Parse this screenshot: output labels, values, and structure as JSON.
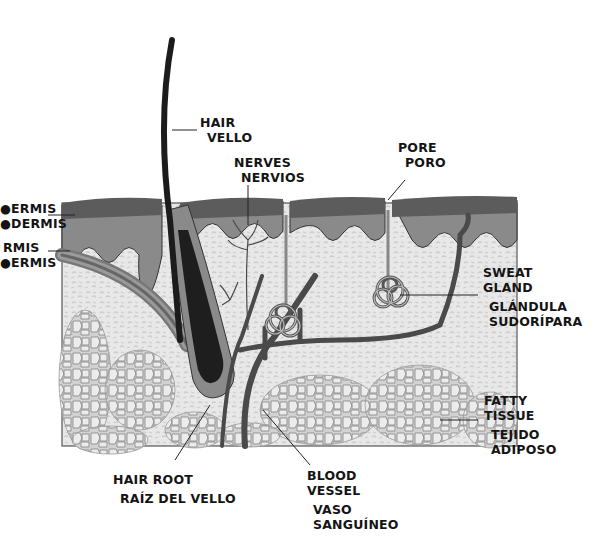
{
  "diagram": {
    "type": "anatomical-cross-section",
    "colors": {
      "epidermis_top": "#5c5c5c",
      "epidermis_base": "#8a8a8a",
      "dermis": "#e6e6e6",
      "dermis_pattern": "#cfcfcf",
      "fat_cells": "#d8d8d8",
      "fat_outline": "#8c8c8c",
      "hair": "#1c1c1c",
      "vessel": "#4a4a4a",
      "label_text": "#141414"
    }
  },
  "labels": {
    "left": {
      "line1": "●ERMIS",
      "line2": "●DERMIS",
      "line3": "RMIS",
      "line4": "●ERMIS"
    },
    "hair": {
      "en": "HAIR",
      "es": "VELLO"
    },
    "nerves": {
      "en": "NERVES",
      "es": "NERVIOS"
    },
    "pore": {
      "en": "PORE",
      "es": "PORO"
    },
    "sweat_gland": {
      "en_1": "SWEAT",
      "en_2": "GLAND",
      "es_1": "GLÁNDULA",
      "es_2": "SUDORÍPARA"
    },
    "fatty_tissue": {
      "en_1": "FATTY",
      "en_2": "TISSUE",
      "es_1": "TEJIDO",
      "es_2": "ADIPOSO"
    },
    "hair_root": {
      "en": "HAIR ROOT",
      "es": "RAÍZ DEL VELLO"
    },
    "blood_vessel": {
      "en_1": "BLOOD",
      "en_2": "VESSEL",
      "es_1": "VASO",
      "es_2": "SANGUÍNEO"
    }
  }
}
